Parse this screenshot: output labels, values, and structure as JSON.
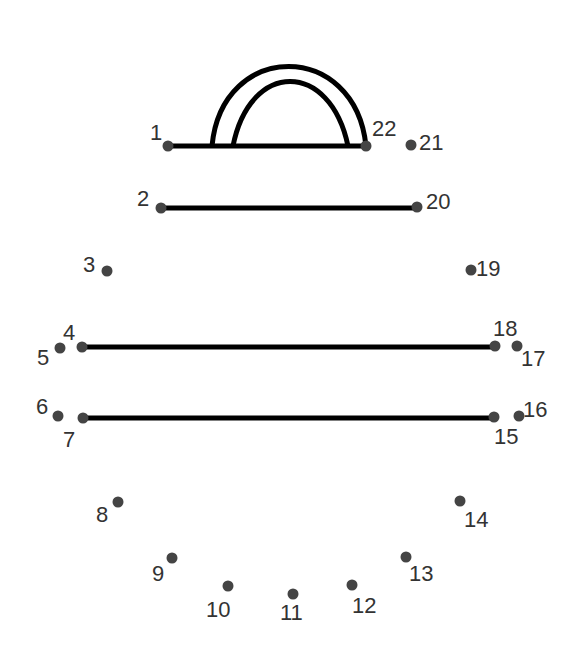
{
  "worksheet": {
    "type": "connect-the-dots",
    "dot_color": "#444444",
    "line_color": "#000000",
    "dots": [
      {
        "n": "1",
        "x": 168,
        "y": 146,
        "lx": 150,
        "ly": 140
      },
      {
        "n": "2",
        "x": 161,
        "y": 208,
        "lx": 137,
        "ly": 206
      },
      {
        "n": "3",
        "x": 107,
        "y": 271,
        "lx": 83,
        "ly": 272
      },
      {
        "n": "4",
        "x": 82,
        "y": 347,
        "lx": 63,
        "ly": 340
      },
      {
        "n": "5",
        "x": 60,
        "y": 348,
        "lx": 37,
        "ly": 365
      },
      {
        "n": "6",
        "x": 58,
        "y": 416,
        "lx": 36,
        "ly": 414
      },
      {
        "n": "7",
        "x": 83,
        "y": 418,
        "lx": 63,
        "ly": 447
      },
      {
        "n": "8",
        "x": 118,
        "y": 502,
        "lx": 96,
        "ly": 522
      },
      {
        "n": "9",
        "x": 172,
        "y": 558,
        "lx": 152,
        "ly": 581
      },
      {
        "n": "10",
        "x": 228,
        "y": 586,
        "lx": 206,
        "ly": 617
      },
      {
        "n": "11",
        "x": 293,
        "y": 594,
        "lx": 280,
        "ly": 620
      },
      {
        "n": "12",
        "x": 352,
        "y": 585,
        "lx": 352,
        "ly": 613
      },
      {
        "n": "13",
        "x": 406,
        "y": 557,
        "lx": 409,
        "ly": 581
      },
      {
        "n": "14",
        "x": 460,
        "y": 501,
        "lx": 464,
        "ly": 527
      },
      {
        "n": "15",
        "x": 494,
        "y": 417,
        "lx": 494,
        "ly": 444
      },
      {
        "n": "16",
        "x": 519,
        "y": 416,
        "lx": 523,
        "ly": 417
      },
      {
        "n": "17",
        "x": 517,
        "y": 346,
        "lx": 521,
        "ly": 366
      },
      {
        "n": "18",
        "x": 495,
        "y": 346,
        "lx": 493,
        "ly": 336
      },
      {
        "n": "19",
        "x": 471,
        "y": 270,
        "lx": 476,
        "ly": 276
      },
      {
        "n": "20",
        "x": 417,
        "y": 207,
        "lx": 426,
        "ly": 209
      },
      {
        "n": "21",
        "x": 411,
        "y": 145,
        "lx": 419,
        "ly": 150
      },
      {
        "n": "22",
        "x": 366,
        "y": 146,
        "lx": 372,
        "ly": 136
      }
    ],
    "lines": [
      {
        "x1": 168,
        "y1": 146,
        "x2": 366,
        "y2": 146
      },
      {
        "x1": 161,
        "y1": 208,
        "x2": 417,
        "y2": 208
      },
      {
        "x1": 82,
        "y1": 347,
        "x2": 495,
        "y2": 347
      },
      {
        "x1": 83,
        "y1": 418,
        "x2": 494,
        "y2": 418
      }
    ],
    "arches": [
      "M 212 146 C 222 40, 355 40, 366 146",
      "M 233 146 C 250 60, 330 60, 348 146"
    ]
  }
}
